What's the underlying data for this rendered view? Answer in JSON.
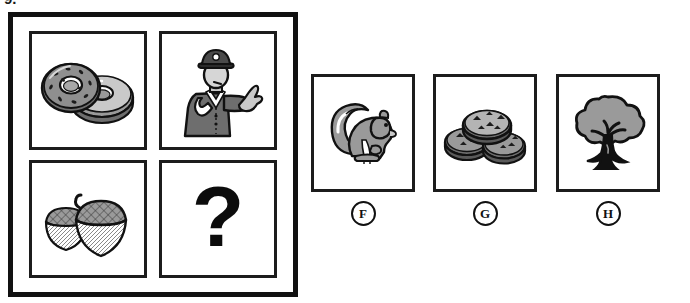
{
  "question": {
    "number_label": "9.",
    "type": "visual-analogy-matrix",
    "prompt_cell": "?"
  },
  "matrix": {
    "name": "analogy-matrix",
    "rows": 2,
    "columns": 2,
    "cells": [
      {
        "position": "top-left",
        "icon": "donuts-icon",
        "label": "donuts"
      },
      {
        "position": "top-right",
        "icon": "police-officer-icon",
        "label": "police officer"
      },
      {
        "position": "bottom-left",
        "icon": "acorns-icon",
        "label": "acorns"
      },
      {
        "position": "bottom-right",
        "icon": "question-mark-icon",
        "label": "?"
      }
    ]
  },
  "options": [
    {
      "letter": "F",
      "icon": "squirrel-icon",
      "label": "squirrel"
    },
    {
      "letter": "G",
      "icon": "cookies-icon",
      "label": "cookies"
    },
    {
      "letter": "H",
      "icon": "tree-icon",
      "label": "tree"
    }
  ],
  "colors": {
    "background": "#ffffff",
    "frame_border": "#111111",
    "cell_border": "#1c1c1c",
    "art_gray": "#9a9a9a",
    "art_gray_dark": "#6e6e6e",
    "art_gray_light": "#c9c9c9",
    "art_black": "#111111",
    "text": "#111111"
  }
}
